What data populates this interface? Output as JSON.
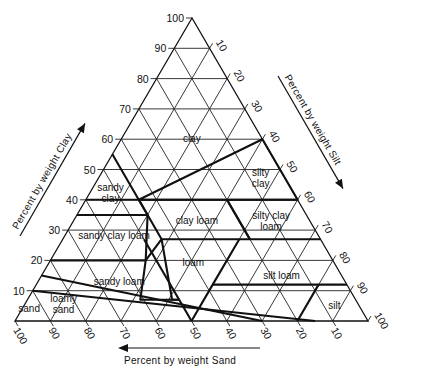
{
  "figure": {
    "type": "soil-texture-triangle",
    "colors": {
      "ink": "#111111",
      "background": "#ffffff"
    },
    "axes": {
      "clay": {
        "title": "Percent by weight Clay",
        "ticks": [
          "10",
          "20",
          "30",
          "40",
          "50",
          "60",
          "70",
          "80",
          "90",
          "100"
        ]
      },
      "silt": {
        "title": "Percent by weight Silt",
        "ticks": [
          "10",
          "20",
          "30",
          "40",
          "50",
          "60",
          "70",
          "80",
          "90",
          "100"
        ]
      },
      "sand": {
        "title": "Percent by weight Sand",
        "ticks": [
          "100",
          "90",
          "80",
          "70",
          "60",
          "50",
          "40",
          "30",
          "20",
          "10"
        ]
      }
    },
    "regions": [
      {
        "name": "clay",
        "label": [
          "clay"
        ],
        "at": {
          "clay": 60,
          "silt": 20
        }
      },
      {
        "name": "sandy-clay",
        "label": [
          "sandy",
          "clay"
        ],
        "at": {
          "clay": 42,
          "silt": 6
        }
      },
      {
        "name": "silty-clay",
        "label": [
          "silty",
          "clay"
        ],
        "at": {
          "clay": 47,
          "silt": 46
        }
      },
      {
        "name": "clay-loam",
        "label": [
          "clay loam"
        ],
        "at": {
          "clay": 33,
          "silt": 35
        }
      },
      {
        "name": "silty-clay-loam",
        "label": [
          "silty clay",
          "loam"
        ],
        "at": {
          "clay": 33,
          "silt": 56
        }
      },
      {
        "name": "sandy-clay-loam",
        "label": [
          "sandy clay loam"
        ],
        "at": {
          "clay": 28,
          "silt": 14
        }
      },
      {
        "name": "loam",
        "label": [
          "loam"
        ],
        "at": {
          "clay": 19,
          "silt": 41
        }
      },
      {
        "name": "sandy-loam",
        "label": [
          "sandy  loam"
        ],
        "at": {
          "clay": 13,
          "silt": 23
        }
      },
      {
        "name": "silt-loam",
        "label": [
          "silt loam"
        ],
        "at": {
          "clay": 15,
          "silt": 68
        }
      },
      {
        "name": "silt",
        "label": [
          "silt"
        ],
        "at": {
          "clay": 5,
          "silt": 88
        }
      },
      {
        "name": "loamy-sand",
        "label": [
          "loamy",
          "sand"
        ],
        "at": {
          "clay": 5.5,
          "silt": 11
        }
      },
      {
        "name": "sand",
        "label": [
          "sand"
        ],
        "at": {
          "clay": 4,
          "silt": 2
        }
      }
    ],
    "boundaries": [
      [
        [
          40,
          0
        ],
        [
          40,
          15
        ],
        [
          60,
          40
        ],
        [
          40,
          60
        ],
        [
          40,
          0
        ]
      ],
      [
        [
          55,
          0
        ],
        [
          35,
          20
        ],
        [
          35,
          0
        ]
      ],
      [
        [
          40,
          60
        ],
        [
          40,
          15
        ]
      ],
      [
        [
          40,
          15
        ],
        [
          27,
          28
        ],
        [
          20,
          27
        ]
      ],
      [
        [
          27,
          53
        ],
        [
          40,
          40
        ]
      ],
      [
        [
          27,
          28
        ],
        [
          27,
          73
        ]
      ],
      [
        [
          40,
          40
        ],
        [
          27,
          53
        ]
      ],
      [
        [
          35,
          20
        ],
        [
          20,
          27
        ]
      ],
      [
        [
          20,
          27
        ],
        [
          20,
          0
        ]
      ],
      [
        [
          27,
          28
        ],
        [
          7,
          41
        ],
        [
          7,
          43
        ]
      ],
      [
        [
          7,
          43
        ],
        [
          0,
          50
        ]
      ],
      [
        [
          27,
          23
        ],
        [
          7,
          43
        ]
      ],
      [
        [
          27,
          50
        ],
        [
          12,
          50
        ],
        [
          0,
          50
        ]
      ],
      [
        [
          12,
          50
        ],
        [
          12,
          80
        ],
        [
          12,
          88
        ]
      ],
      [
        [
          12,
          80
        ],
        [
          0,
          80
        ]
      ],
      [
        [
          0,
          70
        ],
        [
          15,
          0
        ]
      ],
      [
        [
          0,
          85
        ],
        [
          10,
          0
        ]
      ],
      [
        [
          7,
          43
        ],
        [
          7,
          32
        ],
        [
          20,
          27
        ]
      ]
    ],
    "chart_data": {
      "type": "ternary",
      "title": "",
      "axes": [
        "Clay %",
        "Silt %",
        "Sand %"
      ],
      "classes": [
        "clay",
        "sandy clay",
        "silty clay",
        "clay loam",
        "silty clay loam",
        "sandy clay loam",
        "loam",
        "sandy loam",
        "silt loam",
        "silt",
        "loamy sand",
        "sand"
      ],
      "gridlines_every": 10
    }
  }
}
